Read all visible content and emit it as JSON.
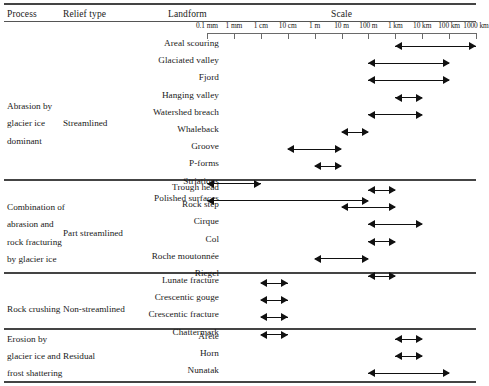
{
  "header": {
    "process": "Process",
    "relief_type": "Relief type",
    "landform": "Landform",
    "scale": "Scale"
  },
  "scale_axis": {
    "ticks": [
      "0.1 mm",
      "1 mm",
      "1 cm",
      "10 cm",
      "1 m",
      "10 m",
      "100 m",
      "1 km",
      "10 km",
      "100 km",
      "1000 km"
    ]
  },
  "chart_data": {
    "type": "table",
    "xlabel": "Scale",
    "x_ticks": [
      "0.1 mm",
      "1 mm",
      "1 cm",
      "10 cm",
      "1 m",
      "10 m",
      "100 m",
      "1 km",
      "10 km",
      "100 km",
      "1000 km"
    ],
    "columns": [
      "Process",
      "Relief type",
      "Landform",
      "Scale"
    ],
    "groups": [
      {
        "process": "Abrasion by glacier ice dominant",
        "process_lines": [
          "Abrasion by",
          "glacier ice",
          "dominant"
        ],
        "relief_type": "Streamlined",
        "rows": [
          {
            "landform": "Areal scouring",
            "from": "1 km",
            "to": "1000 km"
          },
          {
            "landform": "Glaciated valley",
            "from": "100 m",
            "to": "100 km"
          },
          {
            "landform": "Fjord",
            "from": "100 m",
            "to": "100 km"
          },
          {
            "landform": "Hanging valley",
            "from": "1 km",
            "to": "10 km"
          },
          {
            "landform": "Watershed breach",
            "from": "100 m",
            "to": "10 km"
          },
          {
            "landform": "Whaleback",
            "from": "10 m",
            "to": "100 m"
          },
          {
            "landform": "Groove",
            "from": "10 cm",
            "to": "10 m"
          },
          {
            "landform": "P-forms",
            "from": "1 m",
            "to": "10 m"
          },
          {
            "landform": "Striations",
            "from": "0.1 mm",
            "to": "1 cm"
          },
          {
            "landform": "Polished surfaces",
            "from": "0.1 mm",
            "to": "100 m"
          }
        ]
      },
      {
        "process": "Combination of abrasion and rock fracturing by glacier ice",
        "process_lines": [
          "Combination of",
          "abrasion and",
          "rock fracturing",
          "by glacier ice"
        ],
        "relief_type": "Part streamlined",
        "rows": [
          {
            "landform": "Trough head",
            "from": "100 m",
            "to": "1 km"
          },
          {
            "landform": "Rock step",
            "from": "10 m",
            "to": "1 km"
          },
          {
            "landform": "Cirque",
            "from": "100 m",
            "to": "10 km"
          },
          {
            "landform": "Col",
            "from": "100 m",
            "to": "1 km"
          },
          {
            "landform": "Roche moutonnée",
            "from": "1 m",
            "to": "100 m"
          },
          {
            "landform": "Riegel",
            "from": "100 m",
            "to": "1 km"
          }
        ]
      },
      {
        "process": "Rock crushing",
        "process_lines": [
          "Rock crushing"
        ],
        "relief_type": "Non-streamlined",
        "rows": [
          {
            "landform": "Lunate fracture",
            "from": "1 cm",
            "to": "10 cm"
          },
          {
            "landform": "Crescentic gouge",
            "from": "1 cm",
            "to": "10 cm"
          },
          {
            "landform": "Crescentic fracture",
            "from": "1 cm",
            "to": "10 cm"
          },
          {
            "landform": "Chattermark",
            "from": "1 cm",
            "to": "10 cm"
          }
        ]
      },
      {
        "process": "Erosion by glacier ice and frost shattering",
        "process_lines": [
          "Erosion by",
          "glacier ice and",
          "frost shattering"
        ],
        "relief_type": "Residual",
        "rows": [
          {
            "landform": "Arête",
            "from": "1 km",
            "to": "10 km"
          },
          {
            "landform": "Horn",
            "from": "1 km",
            "to": "10 km"
          },
          {
            "landform": "Nunatak",
            "from": "100 m",
            "to": "100 km"
          }
        ]
      }
    ]
  }
}
